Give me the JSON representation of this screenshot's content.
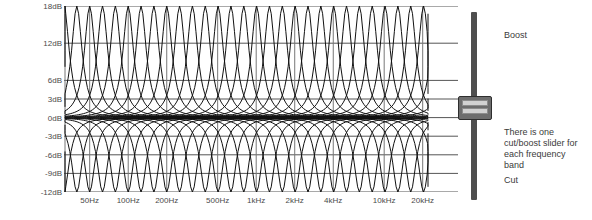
{
  "figure": {
    "background_color": "#ffffff",
    "grid_color": "#555555",
    "curve_color": "#111111",
    "text_color": "#3b3b3b"
  },
  "chart_data": {
    "type": "line",
    "title": "",
    "xlabel": "",
    "ylabel": "",
    "grid": true,
    "legend": "none",
    "ylim": [
      -12,
      18
    ],
    "ytick_labels": [
      "18dB",
      "12dB",
      "6dB",
      "3dB",
      "0dB",
      "-3dB",
      "-6dB",
      "-9dB",
      "-12dB"
    ],
    "ytick_values": [
      18,
      12,
      6,
      3,
      0,
      -3,
      -6,
      -9,
      -12
    ],
    "xtick_labels": [
      "50Hz",
      "100Hz",
      "200Hz",
      "500Hz",
      "1kHz",
      "2kHz",
      "4kHz",
      "10kHz",
      "20kHz"
    ],
    "xtick_values": [
      50,
      100,
      200,
      500,
      1000,
      2000,
      4000,
      10000,
      20000
    ],
    "xscale": "log",
    "band_count": 31,
    "series": [
      {
        "name": "boost-curves",
        "peak_db": 18,
        "description": "31 overlapping band-pass boost curves, one per frequency band"
      },
      {
        "name": "cut-curves",
        "peak_db": -12,
        "description": "31 overlapping band-pass cut curves mirrored below 0dB"
      }
    ]
  },
  "slider": {
    "name": "cut-boost-slider",
    "boost_label": "Boost",
    "cut_label": "Cut",
    "value_db": 0,
    "min_db": -12,
    "max_db": 18,
    "track_color": "#4e4e4e",
    "handle_color": "#6d6d6d"
  },
  "annotations": {
    "note": "There is one\ncut/boost slider for\neach frequency\nband"
  }
}
